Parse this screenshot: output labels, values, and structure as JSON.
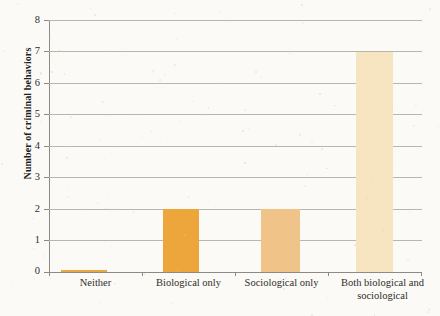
{
  "chart_data": {
    "type": "bar",
    "title": "",
    "xlabel": "",
    "ylabel": "Number of criminal behaviors",
    "categories": [
      "Neither",
      "Biological only",
      "Sociological only",
      "Both biological and sociological"
    ],
    "values": [
      0.05,
      2,
      2,
      7
    ],
    "ylim": [
      0,
      8
    ],
    "yticks": [
      "0",
      "1",
      "2",
      "3",
      "4",
      "5",
      "6",
      "7",
      "8"
    ],
    "grid": true,
    "legend": "none",
    "bar_colors": [
      "#e6a93f",
      "#eda63c",
      "#f0c488",
      "#f7e4c0"
    ],
    "axis_color": "#8d8a86",
    "grid_color": "#b9b6b2",
    "background": "#fbfaf6"
  }
}
